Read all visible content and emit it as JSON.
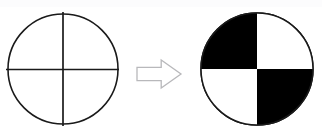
{
  "figure": {
    "title": "",
    "caption": "",
    "background_color": "#ffffff",
    "stroke_color": "#1a1a1a",
    "fill_color": "#000000",
    "arrow_stroke_color": "#b8b8bb",
    "arrow_fill_color": "#ffffff",
    "width": 322,
    "height": 138
  },
  "shapes": {
    "source_circle": {
      "name": "unshaded-quadrant-circle",
      "center_x": 63,
      "center_y": 69,
      "radius": 55,
      "quadrant_labels": [
        "top-left",
        "top-right",
        "bottom-left",
        "bottom-right"
      ],
      "quadrant_fills": [
        "white",
        "white",
        "white",
        "white"
      ],
      "divider_lines": [
        "vertical-diameter",
        "horizontal-diameter"
      ],
      "vertical_line_x": 63,
      "vertical_line_y1": 12,
      "vertical_line_y2": 126,
      "horizontal_line_y": 69,
      "horizontal_line_x1": 6,
      "horizontal_line_x2": 119
    },
    "arrow": {
      "name": "rightward-block-arrow",
      "direction": "right",
      "x": 136,
      "y": 60,
      "width": 45,
      "height": 28,
      "style": "hollow-outline"
    },
    "result_circle": {
      "name": "checkered-quadrant-circle",
      "center_x": 257,
      "center_y": 69,
      "radius": 56,
      "quadrant_labels": [
        "top-left",
        "top-right",
        "bottom-left",
        "bottom-right"
      ],
      "quadrant_fills": [
        "black",
        "white",
        "white",
        "black"
      ],
      "divider_lines": [
        "vertical-diameter",
        "horizontal-diameter"
      ],
      "pattern": "checkerboard"
    }
  }
}
